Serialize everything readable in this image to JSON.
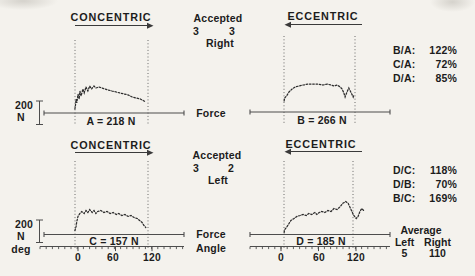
{
  "colors": {
    "paper": "#f4f2ed",
    "ink": "#1c1c1c",
    "line": "#4d4d4d"
  },
  "top": {
    "concentric": "CONCENTRIC",
    "eccentric": "ECCENTRIC",
    "accepted": {
      "title": "Accepted",
      "left_count": "3",
      "right_count": "3",
      "side": "Right"
    },
    "force_label": "Force",
    "scalebar": {
      "value": "200",
      "unit": "N"
    },
    "panel_a_label": "A = 218 N",
    "panel_b_label": "B = 266 N",
    "ratios": [
      {
        "label": "B/A:",
        "value": "122%"
      },
      {
        "label": "C/A:",
        "value": "72%"
      },
      {
        "label": "D/A:",
        "value": "85%"
      }
    ]
  },
  "bottom": {
    "concentric": "CONCENTRIC",
    "eccentric": "ECCENTRIC",
    "accepted": {
      "title": "Accepted",
      "left_count": "3",
      "right_count": "2",
      "side": "Left"
    },
    "force_label": "Force",
    "angle_label": "Angle",
    "scalebar": {
      "value": "200",
      "unit": "N",
      "deg": "deg"
    },
    "panel_c_label": "C = 157 N",
    "panel_d_label": "D = 185 N",
    "ratios": [
      {
        "label": "D/C:",
        "value": "118%"
      },
      {
        "label": "D/B:",
        "value": "70%"
      },
      {
        "label": "B/C:",
        "value": "169%"
      }
    ],
    "left_ticks": [
      "0",
      "60",
      "120"
    ],
    "right_ticks": [
      "0",
      "60",
      "120"
    ],
    "average": {
      "title": "Average",
      "left_label": "Left",
      "right_label": "Right",
      "left_value": "5",
      "right_value": "110"
    }
  },
  "chart_data": [
    {
      "id": "A",
      "type": "line",
      "condition": "CONCENTRIC",
      "side": "Right",
      "label": "A = 218 N",
      "mean_force_N": 218,
      "x_unit": "deg",
      "y_unit": "N",
      "scale_bar_N": 200,
      "window_deg": [
        -5,
        113
      ],
      "points": [
        [
          -5,
          35
        ],
        [
          -4,
          70
        ],
        [
          -3,
          122
        ],
        [
          -2,
          87
        ],
        [
          0,
          165
        ],
        [
          2,
          122
        ],
        [
          3,
          191
        ],
        [
          5,
          148
        ],
        [
          8,
          209
        ],
        [
          10,
          174
        ],
        [
          13,
          226
        ],
        [
          16,
          191
        ],
        [
          19,
          235
        ],
        [
          22,
          209
        ],
        [
          26,
          235
        ],
        [
          29,
          217
        ],
        [
          34,
          226
        ],
        [
          39,
          217
        ],
        [
          44,
          209
        ],
        [
          49,
          200
        ],
        [
          55,
          191
        ],
        [
          62,
          183
        ],
        [
          68,
          174
        ],
        [
          75,
          165
        ],
        [
          81,
          157
        ],
        [
          88,
          139
        ],
        [
          94,
          130
        ],
        [
          101,
          122
        ],
        [
          107,
          104
        ],
        [
          110,
          96
        ]
      ]
    },
    {
      "id": "B",
      "type": "line",
      "condition": "ECCENTRIC",
      "side": "Right",
      "label": "B = 266 N",
      "mean_force_N": 266,
      "x_unit": "deg",
      "y_unit": "N",
      "scale_bar_N": 200,
      "window_deg": [
        5,
        120
      ],
      "points": [
        [
          5,
          96
        ],
        [
          6,
          122
        ],
        [
          10,
          148
        ],
        [
          13,
          174
        ],
        [
          18,
          200
        ],
        [
          23,
          217
        ],
        [
          29,
          226
        ],
        [
          36,
          235
        ],
        [
          44,
          243
        ],
        [
          52,
          243
        ],
        [
          60,
          243
        ],
        [
          68,
          235
        ],
        [
          75,
          243
        ],
        [
          81,
          235
        ],
        [
          86,
          226
        ],
        [
          91,
          235
        ],
        [
          96,
          217
        ],
        [
          99,
          200
        ],
        [
          102,
          165
        ],
        [
          104,
          130
        ],
        [
          107,
          174
        ],
        [
          110,
          209
        ],
        [
          114,
          165
        ],
        [
          117,
          130
        ],
        [
          118,
          148
        ]
      ]
    },
    {
      "id": "C",
      "type": "line",
      "condition": "CONCENTRIC",
      "side": "Left",
      "label": "C = 157 N",
      "mean_force_N": 157,
      "x_unit": "deg",
      "y_unit": "N",
      "scale_bar_N": 200,
      "window_deg": [
        -5,
        113
      ],
      "points": [
        [
          -5,
          35
        ],
        [
          -3,
          70
        ],
        [
          -2,
          113
        ],
        [
          0,
          157
        ],
        [
          3,
          183
        ],
        [
          6,
          200
        ],
        [
          10,
          183
        ],
        [
          13,
          209
        ],
        [
          16,
          191
        ],
        [
          19,
          217
        ],
        [
          23,
          191
        ],
        [
          26,
          209
        ],
        [
          29,
          183
        ],
        [
          32,
          200
        ],
        [
          37,
          209
        ],
        [
          42,
          191
        ],
        [
          47,
          200
        ],
        [
          52,
          183
        ],
        [
          57,
          191
        ],
        [
          62,
          174
        ],
        [
          66,
          183
        ],
        [
          71,
          165
        ],
        [
          76,
          174
        ],
        [
          81,
          157
        ],
        [
          86,
          165
        ],
        [
          91,
          148
        ],
        [
          96,
          139
        ],
        [
          100,
          122
        ],
        [
          104,
          104
        ],
        [
          107,
          78
        ],
        [
          110,
          61
        ]
      ]
    },
    {
      "id": "D",
      "type": "line",
      "condition": "ECCENTRIC",
      "side": "Left",
      "label": "D = 185 N",
      "mean_force_N": 185,
      "x_unit": "deg",
      "y_unit": "N",
      "scale_bar_N": 200,
      "window_deg": [
        5,
        117
      ],
      "points": [
        [
          5,
          17
        ],
        [
          6,
          43
        ],
        [
          10,
          70
        ],
        [
          13,
          96
        ],
        [
          16,
          122
        ],
        [
          21,
          139
        ],
        [
          26,
          157
        ],
        [
          31,
          165
        ],
        [
          36,
          174
        ],
        [
          41,
          165
        ],
        [
          45,
          183
        ],
        [
          50,
          174
        ],
        [
          55,
          191
        ],
        [
          58,
          174
        ],
        [
          62,
          191
        ],
        [
          66,
          200
        ],
        [
          71,
          191
        ],
        [
          76,
          209
        ],
        [
          81,
          200
        ],
        [
          86,
          226
        ],
        [
          91,
          217
        ],
        [
          96,
          243
        ],
        [
          100,
          270
        ],
        [
          105,
          287
        ],
        [
          109,
          270
        ],
        [
          112,
          235
        ],
        [
          115,
          200
        ],
        [
          118,
          165
        ],
        [
          122,
          139
        ],
        [
          125,
          157
        ],
        [
          128,
          200
        ],
        [
          131,
          226
        ],
        [
          134,
          209
        ]
      ]
    }
  ]
}
